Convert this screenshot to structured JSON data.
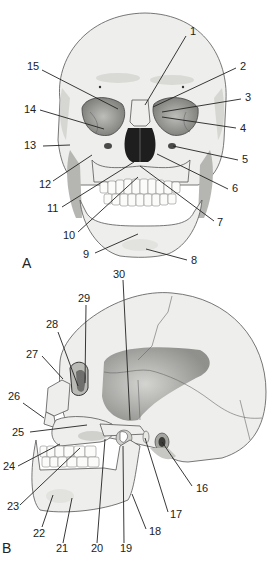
{
  "figure": {
    "panels": [
      {
        "id": "A",
        "view": "anterior skull",
        "labels": [
          {
            "n": "1",
            "tx": 190,
            "ty": 35,
            "x1": 186,
            "y1": 36,
            "x2": 145,
            "y2": 105
          },
          {
            "n": "2",
            "tx": 240,
            "ty": 70,
            "x1": 236,
            "y1": 68,
            "x2": 153,
            "y2": 107
          },
          {
            "n": "3",
            "tx": 245,
            "ty": 101,
            "x1": 241,
            "y1": 99,
            "x2": 162,
            "y2": 112
          },
          {
            "n": "4",
            "tx": 240,
            "ty": 132,
            "x1": 236,
            "y1": 128,
            "x2": 162,
            "y2": 117
          },
          {
            "n": "5",
            "tx": 242,
            "ty": 163,
            "x1": 238,
            "y1": 160,
            "x2": 173,
            "y2": 146
          },
          {
            "n": "6",
            "tx": 232,
            "ty": 192,
            "x1": 228,
            "y1": 189,
            "x2": 157,
            "y2": 154
          },
          {
            "n": "7",
            "tx": 217,
            "ty": 226,
            "x1": 214,
            "y1": 221,
            "x2": 140,
            "y2": 166
          },
          {
            "n": "8",
            "tx": 191,
            "ty": 264,
            "x1": 187,
            "y1": 260,
            "x2": 146,
            "y2": 249
          },
          {
            "n": "9",
            "tx": 83,
            "ty": 258,
            "x1": 95,
            "y1": 253,
            "x2": 138,
            "y2": 234
          },
          {
            "n": "10",
            "tx": 63,
            "ty": 239,
            "x1": 78,
            "y1": 232,
            "x2": 138,
            "y2": 177
          },
          {
            "n": "11",
            "tx": 47,
            "ty": 212,
            "x1": 62,
            "y1": 207,
            "x2": 134,
            "y2": 162
          },
          {
            "n": "12",
            "tx": 39,
            "ty": 188,
            "x1": 53,
            "y1": 181,
            "x2": 92,
            "y2": 155
          },
          {
            "n": "13",
            "tx": 24,
            "ty": 149,
            "x1": 43,
            "y1": 146,
            "x2": 70,
            "y2": 145
          },
          {
            "n": "14",
            "tx": 24,
            "ty": 113,
            "x1": 40,
            "y1": 110,
            "x2": 104,
            "y2": 129
          },
          {
            "n": "15",
            "tx": 27,
            "ty": 70,
            "x1": 42,
            "y1": 70,
            "x2": 118,
            "y2": 109
          }
        ],
        "panel_label": {
          "text": "A",
          "x": 22,
          "y": 268
        }
      },
      {
        "id": "B",
        "view": "lateral skull",
        "labels": [
          {
            "n": "16",
            "tx": 196,
            "ty": 492,
            "x1": 192,
            "y1": 486,
            "x2": 162,
            "y2": 442
          },
          {
            "n": "17",
            "tx": 170,
            "ty": 518,
            "x1": 168,
            "y1": 512,
            "x2": 145,
            "y2": 438
          },
          {
            "n": "18",
            "tx": 149,
            "ty": 535,
            "x1": 146,
            "y1": 529,
            "x2": 132,
            "y2": 494
          },
          {
            "n": "19",
            "tx": 120,
            "ty": 552,
            "x1": 124,
            "y1": 543,
            "x2": 123,
            "y2": 446
          },
          {
            "n": "20",
            "tx": 91,
            "ty": 552,
            "x1": 97,
            "y1": 543,
            "x2": 105,
            "y2": 439
          },
          {
            "n": "21",
            "tx": 56,
            "ty": 552,
            "x1": 63,
            "y1": 543,
            "x2": 72,
            "y2": 498
          },
          {
            "n": "22",
            "tx": 33,
            "ty": 537,
            "x1": 42,
            "y1": 527,
            "x2": 53,
            "y2": 495
          },
          {
            "n": "23",
            "tx": 7,
            "ty": 510,
            "x1": 20,
            "y1": 505,
            "x2": 80,
            "y2": 448
          },
          {
            "n": "24",
            "tx": 3,
            "ty": 470,
            "x1": 18,
            "y1": 466,
            "x2": 60,
            "y2": 444
          },
          {
            "n": "25",
            "tx": 12,
            "ty": 436,
            "x1": 30,
            "y1": 432,
            "x2": 87,
            "y2": 425
          },
          {
            "n": "26",
            "tx": 8,
            "ty": 400,
            "x1": 23,
            "y1": 403,
            "x2": 44,
            "y2": 418
          },
          {
            "n": "27",
            "tx": 26,
            "ty": 358,
            "x1": 42,
            "y1": 356,
            "x2": 63,
            "y2": 379
          },
          {
            "n": "28",
            "tx": 46,
            "ty": 328,
            "x1": 58,
            "y1": 332,
            "x2": 78,
            "y2": 386
          },
          {
            "n": "29",
            "tx": 78,
            "ty": 302,
            "x1": 86,
            "y1": 305,
            "x2": 85,
            "y2": 383
          },
          {
            "n": "30",
            "tx": 113,
            "ty": 278,
            "x1": 123,
            "y1": 280,
            "x2": 130,
            "y2": 420
          }
        ],
        "panel_label": {
          "text": "B",
          "x": 2,
          "y": 553
        }
      }
    ]
  }
}
